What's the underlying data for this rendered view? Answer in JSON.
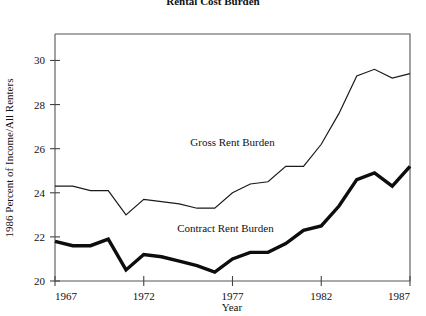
{
  "chart_data": {
    "type": "line",
    "title": "Rental Cost Burden",
    "title_clipped": true,
    "xlabel": "Year",
    "ylabel": "1986 Percent of Income/All Renters",
    "xlim": [
      1967,
      1987
    ],
    "ylim": [
      20,
      31.2
    ],
    "grid": false,
    "legend_position": "inline-annotation",
    "x_ticks": [
      "1967",
      "1972",
      "1977",
      "1982",
      "1987"
    ],
    "x_tick_values": [
      1967,
      1972,
      1977,
      1982,
      1987
    ],
    "y_ticks": [
      "20",
      "22",
      "24",
      "26",
      "28",
      "30"
    ],
    "y_tick_values": [
      20,
      22,
      24,
      26,
      28,
      30
    ],
    "x": [
      1967,
      1968,
      1969,
      1970,
      1971,
      1972,
      1973,
      1974,
      1975,
      1976,
      1977,
      1978,
      1979,
      1980,
      1981,
      1982,
      1983,
      1984,
      1985,
      1986,
      1987
    ],
    "series": [
      {
        "name": "Gross Rent Burden",
        "label": "Gross Rent Burden",
        "style": "thin",
        "color": "#1a1a1a",
        "label_x": 1977.0,
        "label_y": 26.1,
        "values": [
          24.3,
          24.3,
          24.1,
          24.1,
          23.0,
          23.7,
          23.6,
          23.5,
          23.3,
          23.3,
          24.0,
          24.4,
          24.5,
          25.2,
          25.2,
          26.2,
          27.6,
          29.3,
          29.6,
          29.2,
          29.4
        ]
      },
      {
        "name": "Contract Rent Burden",
        "label": "Contract Rent Burden",
        "style": "thick",
        "color": "#0d0d0d",
        "label_x": 1976.6,
        "label_y": 22.2,
        "values": [
          21.8,
          21.6,
          21.6,
          21.9,
          20.5,
          21.2,
          21.1,
          20.9,
          20.7,
          20.4,
          21.0,
          21.3,
          21.3,
          21.7,
          22.3,
          22.5,
          23.4,
          24.6,
          24.9,
          24.3,
          25.2
        ]
      }
    ],
    "series_end_values": {
      "Gross Rent Burden": 30.0,
      "Contract Rent Burden": 25.7
    }
  }
}
